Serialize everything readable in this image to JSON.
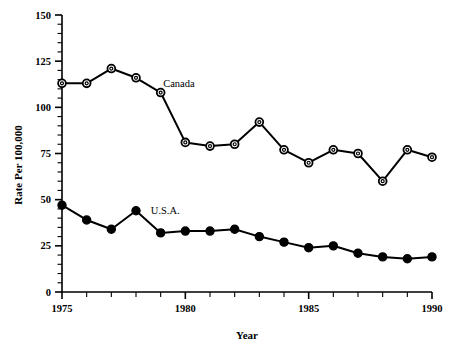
{
  "chart_data": {
    "type": "line",
    "title": "",
    "xlabel": "Year",
    "ylabel": "Rate Per 100,000",
    "x": [
      1975,
      1976,
      1977,
      1978,
      1979,
      1980,
      1981,
      1982,
      1983,
      1984,
      1985,
      1986,
      1987,
      1988,
      1989,
      1990
    ],
    "xlim": [
      1975,
      1990
    ],
    "ylim": [
      0,
      150
    ],
    "ytick_labels": [
      "0",
      "25",
      "50",
      "75",
      "100",
      "125",
      "150"
    ],
    "ytick_values": [
      0,
      25,
      50,
      75,
      100,
      125,
      150
    ],
    "yminor_step": 5,
    "xtick_labels": [
      "1975",
      "1980",
      "1985",
      "1990"
    ],
    "xtick_values": [
      1975,
      1980,
      1985,
      1990
    ],
    "xminor_step": 1,
    "grid": false,
    "legend_position": "inline-annotation",
    "series": [
      {
        "name": "Canada",
        "marker": "open-circle",
        "color": "#000000",
        "label_x": 1979.1,
        "label_y": 113,
        "values": [
          113,
          113,
          121,
          116,
          108,
          81,
          79,
          80,
          92,
          77,
          70,
          77,
          75,
          60,
          77,
          73
        ]
      },
      {
        "name": "U.S.A.",
        "marker": "filled-circle",
        "color": "#000000",
        "label_x": 1978.6,
        "label_y": 44,
        "values": [
          47,
          39,
          34,
          44,
          32,
          33,
          33,
          34,
          30,
          27,
          24,
          25,
          21,
          19,
          18,
          19
        ]
      }
    ]
  }
}
